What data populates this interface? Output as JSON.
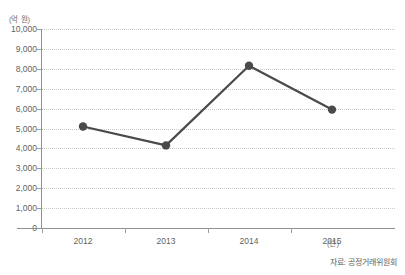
{
  "title": "",
  "axes": {
    "y_unit": "(억 원)",
    "x_unit": "(년)"
  },
  "source_note": "자료: 공정거래위원회",
  "colors": {
    "series": "#4a4a4a",
    "grid": "#c5c8cc",
    "axis": "#8e9195",
    "text": "#5f5f5f"
  },
  "chart_data": {
    "type": "line",
    "title": "",
    "xlabel": "(년)",
    "ylabel": "(억 원)",
    "categories": [
      "2012",
      "2013",
      "2014",
      "2015"
    ],
    "values": [
      5100,
      4150,
      8150,
      5950
    ],
    "ylim": [
      0,
      10000
    ],
    "yticks": [
      0,
      1000,
      2000,
      3000,
      4000,
      5000,
      6000,
      7000,
      8000,
      9000,
      10000
    ],
    "ytick_labels": [
      "0",
      "1,000",
      "2,000",
      "3,000",
      "4,000",
      "5,000",
      "6,000",
      "7,000",
      "8,000",
      "9,000",
      "10,000"
    ],
    "grid": true,
    "legend": false,
    "marker": "circle",
    "series_color": "#4a4a4a"
  }
}
